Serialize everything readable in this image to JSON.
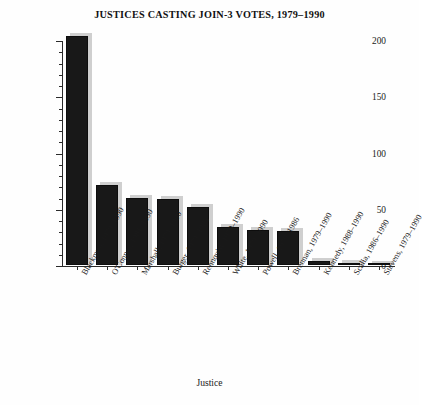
{
  "chart_data": {
    "type": "bar",
    "title": "JUSTICES CASTING JOIN-3 VOTES, 1979–1990",
    "xlabel": "Justice",
    "ylabel": "Number of Join-3 Votes Cast",
    "ylim": [
      0,
      200
    ],
    "ytick_values": [
      0,
      50,
      100,
      150,
      200
    ],
    "ytick_labels": [
      "0",
      "50",
      "100",
      "150",
      "200"
    ],
    "yminor_step": 10,
    "grid": false,
    "legend": false,
    "bar_color": "#181818",
    "shadow_color": "#cfcfcf",
    "categories": [
      "Blackmun, 1979–1990",
      "O'Connor, 1981–1990",
      "Marshall, 1979–1990",
      "Burger, 1979–1985",
      "Rehnquist, 1979–1990",
      "White, 1979–1990",
      "Powell, 1979–1986",
      "Brennan, 1979–1990",
      "Kennedy, 1988–1990",
      "Scalia, 1986–1990",
      "Stevens, 1979–1990"
    ],
    "values": [
      204,
      71,
      60,
      59,
      52,
      34,
      31,
      30,
      4,
      2,
      1
    ]
  }
}
